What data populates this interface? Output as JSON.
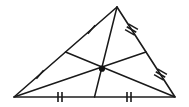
{
  "figure": {
    "kind": "geometry-diagram",
    "canvas": {
      "width": 189,
      "height": 107,
      "background": "#ffffff"
    },
    "colors": {
      "stroke": "#1a1a1a",
      "base_stroke": "#555555",
      "centroid_fill": "#111111"
    },
    "vertices": {
      "apex": {
        "name": "top-vertex",
        "x": 117,
        "y": 7
      },
      "left": {
        "name": "bottom-left-vertex",
        "x": 14,
        "y": 97
      },
      "right": {
        "name": "bottom-right-vertex",
        "x": 175,
        "y": 97
      }
    },
    "midpoints": {
      "left_side": {
        "name": "midpoint-left-side",
        "x": 65.5,
        "y": 52
      },
      "right_side": {
        "name": "midpoint-right-side",
        "x": 146,
        "y": 52
      },
      "base": {
        "name": "midpoint-base",
        "x": 94.5,
        "y": 97
      }
    },
    "centroid": {
      "name": "centroid",
      "x": 102,
      "y": 68.7,
      "radius": 3.1
    },
    "sides": [
      {
        "name": "side-left",
        "from": "left",
        "to": "apex",
        "tick_count": 1
      },
      {
        "name": "side-right",
        "from": "apex",
        "to": "right",
        "tick_count": 3
      },
      {
        "name": "side-base",
        "from": "left",
        "to": "right",
        "tick_count": 2
      }
    ],
    "medians": [
      {
        "name": "median-from-apex",
        "from": "apex",
        "to": "midpoint-base"
      },
      {
        "name": "median-from-left",
        "from": "left",
        "to": "midpoint-right-side"
      },
      {
        "name": "median-from-right",
        "from": "right",
        "to": "midpoint-left-side"
      }
    ],
    "tick_marks": [
      {
        "name": "tick-left-upper",
        "segment": "apex-to-left-midpoint",
        "count": 1,
        "cx": 91.5,
        "cy": 29.5,
        "angle": 41,
        "length": 11
      },
      {
        "name": "tick-left-lower",
        "segment": "left-midpoint-to-left-vertex",
        "count": 1,
        "cx": 40,
        "cy": 74.5,
        "angle": 41,
        "length": 11
      },
      {
        "name": "tick-right-upper",
        "segment": "apex-to-right-midpoint",
        "count": 3,
        "cx": 131.5,
        "cy": 29.5,
        "angle": -60,
        "length": 11,
        "spacing": 3.2
      },
      {
        "name": "tick-right-lower",
        "segment": "right-midpoint-to-right-vertex",
        "count": 3,
        "cx": 160.5,
        "cy": 74.5,
        "angle": -60,
        "length": 11,
        "spacing": 3.2
      },
      {
        "name": "tick-base-left",
        "segment": "left-vertex-to-base-midpoint",
        "count": 2,
        "cx": 60,
        "cy": 97,
        "angle": 90,
        "length": 10,
        "spacing": 4
      },
      {
        "name": "tick-base-right",
        "segment": "base-midpoint-to-right-vertex",
        "count": 2,
        "cx": 129,
        "cy": 97,
        "angle": 90,
        "length": 10,
        "spacing": 4
      }
    ]
  }
}
